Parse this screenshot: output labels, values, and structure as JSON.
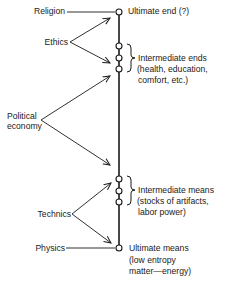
{
  "diagram": {
    "left_labels": {
      "religion": "Religion",
      "ethics": "Ethics",
      "political_economy_line1": "Political",
      "political_economy_line2": "economy",
      "technics": "Technics",
      "physics": "Physics"
    },
    "right_labels": {
      "ultimate_end": "Ultimate end (?)",
      "intermediate_ends": "Intermediate ends",
      "intermediate_ends_detail_line1": "(health, education,",
      "intermediate_ends_detail_line2": "comfort, etc.)",
      "intermediate_means": "Intermediate means",
      "intermediate_means_detail_line1": "(stocks of artifacts,",
      "intermediate_means_detail_line2": "labor power)",
      "ultimate_means": "Ultimate means",
      "ultimate_means_detail_line1": "(low entropy",
      "ultimate_means_detail_line2": "matter—energy)"
    },
    "colors": {
      "ink": "#1a1a1a",
      "background": "#ffffff"
    }
  }
}
